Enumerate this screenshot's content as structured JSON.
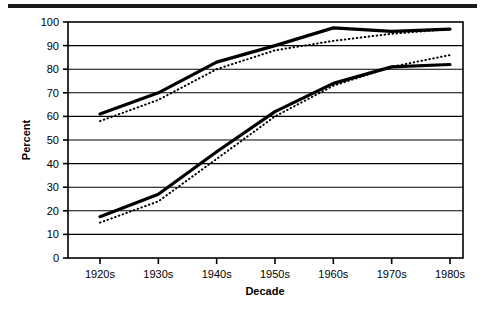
{
  "figure": {
    "top_rule": "horizontal-rule",
    "background_color": "#ffffff",
    "ink_color": "#000000"
  },
  "chart_data": {
    "type": "line",
    "title": "",
    "subtitle": "",
    "xlabel": "Decade",
    "ylabel": "Percent",
    "categories": [
      "1920s",
      "1930s",
      "1940s",
      "1950s",
      "1960s",
      "1970s",
      "1980s"
    ],
    "x_tick_labels": [
      "1920s",
      "1930s",
      "1940s",
      "1950s",
      "1960s",
      "1970s",
      "1980s"
    ],
    "y_tick_labels": [
      "0",
      "10",
      "20",
      "30",
      "40",
      "50",
      "60",
      "70",
      "80",
      "90",
      "100"
    ],
    "y_ticks": [
      0,
      10,
      20,
      30,
      40,
      50,
      60,
      70,
      80,
      90,
      100
    ],
    "ylim": [
      0,
      100
    ],
    "grid": "horizontal",
    "legend": "none",
    "series": [
      {
        "name": "upper-solid",
        "style": "solid",
        "width": 3.2,
        "color": "#000000",
        "values": [
          61,
          70,
          83,
          90,
          97.5,
          96,
          97
        ]
      },
      {
        "name": "upper-dotted",
        "style": "dotted",
        "width": 2.0,
        "color": "#000000",
        "values": [
          58,
          67,
          80,
          88,
          92,
          95,
          97
        ]
      },
      {
        "name": "lower-solid",
        "style": "solid",
        "width": 3.2,
        "color": "#000000",
        "values": [
          17.5,
          27,
          45,
          62,
          74,
          81,
          82
        ]
      },
      {
        "name": "lower-dotted",
        "style": "dotted",
        "width": 2.0,
        "color": "#000000",
        "values": [
          15,
          24,
          42,
          60,
          73,
          81,
          86
        ]
      }
    ]
  }
}
